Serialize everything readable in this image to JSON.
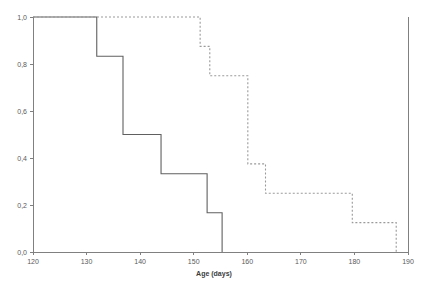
{
  "chart_data": {
    "type": "line",
    "subtype": "step-survival-curve",
    "title": "",
    "xlabel": "Age (days)",
    "ylabel": "",
    "xlim": [
      120,
      190
    ],
    "ylim": [
      0.0,
      1.0
    ],
    "grid": false,
    "legend": "none",
    "decimal_separator": ",",
    "x_ticks": [
      120,
      130,
      140,
      150,
      160,
      170,
      180,
      190
    ],
    "x_tick_labels": [
      "120",
      "130",
      "140",
      "150",
      "160",
      "170",
      "180",
      "190"
    ],
    "y_ticks": [
      0.0,
      0.2,
      0.4,
      0.6,
      0.8,
      1.0
    ],
    "y_tick_labels": [
      "0,0",
      "0,2",
      "0,4",
      "0,6",
      "0,8",
      "1,0"
    ],
    "series": [
      {
        "name": "solid-curve",
        "style": "solid",
        "color": "#606060",
        "step": "post",
        "x": [
          120,
          131.9,
          131.9,
          136.8,
          136.8,
          143.9,
          143.9,
          152.5,
          152.5,
          155.3,
          155.3
        ],
        "y": [
          1.0,
          1.0,
          0.833,
          0.833,
          0.5,
          0.5,
          0.333,
          0.333,
          0.167,
          0.167,
          0.0
        ],
        "drop_points": [
          {
            "x": 131.9,
            "from": 1.0,
            "to": 0.833
          },
          {
            "x": 136.8,
            "from": 0.833,
            "to": 0.5
          },
          {
            "x": 143.9,
            "from": 0.5,
            "to": 0.333
          },
          {
            "x": 152.5,
            "from": 0.333,
            "to": 0.167
          },
          {
            "x": 155.3,
            "from": 0.167,
            "to": 0.0
          }
        ]
      },
      {
        "name": "dotted-curve",
        "style": "dotted",
        "color": "#9a9a9a",
        "step": "post",
        "x": [
          120,
          151.2,
          151.2,
          153.0,
          153.0,
          160.1,
          160.1,
          163.4,
          163.4,
          179.6,
          179.6,
          187.8,
          187.8
        ],
        "y": [
          1.0,
          1.0,
          0.875,
          0.875,
          0.75,
          0.75,
          0.375,
          0.375,
          0.25,
          0.25,
          0.125,
          0.125,
          0.0
        ],
        "drop_points": [
          {
            "x": 151.2,
            "from": 1.0,
            "to": 0.875
          },
          {
            "x": 153.0,
            "from": 0.875,
            "to": 0.75
          },
          {
            "x": 160.1,
            "from": 0.75,
            "to": 0.375
          },
          {
            "x": 163.4,
            "from": 0.375,
            "to": 0.25
          },
          {
            "x": 179.6,
            "from": 0.25,
            "to": 0.125
          },
          {
            "x": 187.8,
            "from": 0.125,
            "to": 0.0
          }
        ]
      }
    ]
  }
}
